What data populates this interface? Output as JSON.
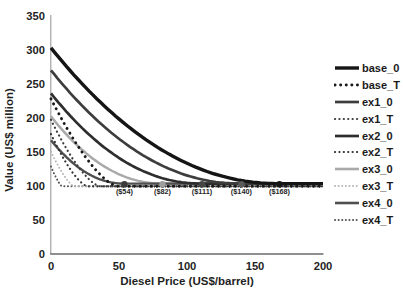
{
  "figure": {
    "background_color": "#ffffff",
    "text_color": "#1f1f1f"
  },
  "chart_data": {
    "type": "line",
    "title": "",
    "xlabel": "Diesel Price (US$/barrel)",
    "ylabel": "Value (US$ million)",
    "xlim": [
      0,
      200
    ],
    "ylim": [
      0,
      350
    ],
    "x_ticks": [
      0,
      50,
      100,
      150,
      200
    ],
    "y_ticks": [
      0,
      50,
      100,
      150,
      200,
      250,
      300,
      350
    ],
    "grid": false,
    "legend_position": "right",
    "series": [
      {
        "name": "base_0",
        "style": "solid",
        "color": "#151515",
        "width": 3.4,
        "start_value": 303,
        "floor_value": 103,
        "floor_x": 168,
        "shape_power": 2.1
      },
      {
        "name": "base_T",
        "style": "dotted",
        "color": "#1a1a1a",
        "width": 2.9,
        "start_value": 228,
        "floor_value": 99,
        "floor_x": 49,
        "shape_power": 1.5
      },
      {
        "name": "ex1_0",
        "style": "solid",
        "color": "#3d3d3d",
        "width": 2.7,
        "start_value": 270,
        "floor_value": 103,
        "floor_x": 140,
        "shape_power": 2.1
      },
      {
        "name": "ex1_T",
        "style": "dotted",
        "color": "#3d3d3d",
        "width": 2.2,
        "start_value": 197,
        "floor_value": 99,
        "floor_x": 36,
        "shape_power": 1.5
      },
      {
        "name": "ex2_0",
        "style": "solid",
        "color": "#2e2e2e",
        "width": 2.7,
        "start_value": 236,
        "floor_value": 103,
        "floor_x": 111,
        "shape_power": 2.1
      },
      {
        "name": "ex2_T",
        "style": "dotted",
        "color": "#333333",
        "width": 2.2,
        "start_value": 176,
        "floor_value": 99,
        "floor_x": 27,
        "shape_power": 1.5
      },
      {
        "name": "ex3_0",
        "style": "solid",
        "color": "#a9a9a9",
        "width": 2.5,
        "start_value": 202,
        "floor_value": 103,
        "floor_x": 82,
        "shape_power": 2.1
      },
      {
        "name": "ex3_T",
        "style": "dotted",
        "color": "#b5b5b5",
        "width": 1.9,
        "start_value": 150,
        "floor_value": 99,
        "floor_x": 17,
        "shape_power": 1.4
      },
      {
        "name": "ex4_0",
        "style": "solid",
        "color": "#4f4f4f",
        "width": 2.4,
        "start_value": 167,
        "floor_value": 103,
        "floor_x": 54,
        "shape_power": 2.1
      },
      {
        "name": "ex4_T",
        "style": "dotted",
        "color": "#555555",
        "width": 2.0,
        "start_value": 128,
        "floor_value": 99,
        "floor_x": 8,
        "shape_power": 1.3
      }
    ],
    "annotations": [
      {
        "label": "($54)",
        "x": 54,
        "y": 100,
        "marker_color": "#3a3a3a"
      },
      {
        "label": "($82)",
        "x": 82,
        "y": 100,
        "marker_color": "#9e9e9e"
      },
      {
        "label": "($111)",
        "x": 111,
        "y": 100,
        "marker_color": "#454545"
      },
      {
        "label": "($140)",
        "x": 140,
        "y": 100,
        "marker_color": "#5a5a5a"
      },
      {
        "label": "($168)",
        "x": 168,
        "y": 100,
        "marker_color": "#161616"
      }
    ]
  }
}
